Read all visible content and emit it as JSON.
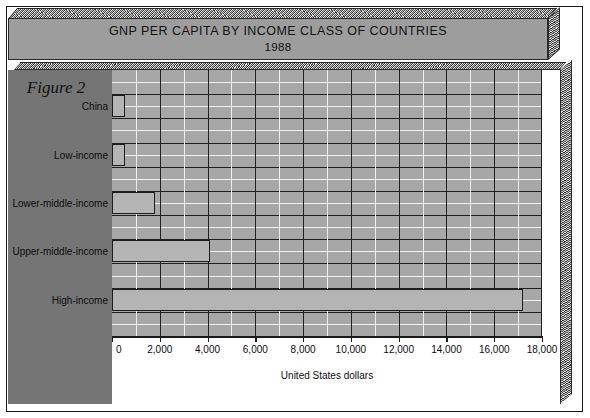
{
  "figure": {
    "label": "Figure 2"
  },
  "title": {
    "line1": "GNP PER CAPITA BY INCOME CLASS OF COUNTRIES",
    "line2": "1988"
  },
  "colors": {
    "plot_background": "#a7a7a7",
    "bar_fill": "#b4b4b4",
    "bar_outline": "#1c1c1c",
    "left_panel": "#757575",
    "grid_major": "#1f1f1f",
    "grid_minor": "#efefef",
    "slab_face": "#9d9d9d"
  },
  "chart_data": {
    "type": "bar",
    "orientation": "horizontal",
    "title": "GNP PER CAPITA BY INCOME CLASS OF COUNTRIES 1988",
    "xlabel": "United States dollars",
    "ylabel": "",
    "categories": [
      "China",
      "Low-income",
      "Lower-middle-income",
      "Upper-middle-income",
      "High-income"
    ],
    "values": [
      560,
      550,
      1780,
      4100,
      17200
    ],
    "xlim": [
      0,
      18000
    ],
    "xticks": [
      0,
      2000,
      4000,
      6000,
      8000,
      10000,
      12000,
      14000,
      16000,
      18000
    ],
    "xtick_labels": [
      "0",
      "2,000",
      "4,000",
      "6,000",
      "8,000",
      "10,000",
      "12,000",
      "14,000",
      "16,000",
      "18,000"
    ],
    "minor_tick_interval": 1000,
    "grid": true,
    "legend": false
  }
}
